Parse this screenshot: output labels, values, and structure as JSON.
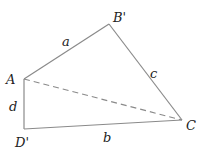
{
  "diagram": {
    "title": "",
    "vertices": [
      {
        "id": "A",
        "label": "A",
        "x": 24,
        "y": 79,
        "lx": 6,
        "ly": 84
      },
      {
        "id": "B'",
        "label": "B'",
        "x": 109,
        "y": 24,
        "lx": 113,
        "ly": 22
      },
      {
        "id": "C",
        "label": "C",
        "x": 182,
        "y": 120,
        "lx": 186,
        "ly": 130
      },
      {
        "id": "D'",
        "label": "D'",
        "x": 24,
        "y": 129,
        "lx": 15,
        "ly": 147
      }
    ],
    "edges": [
      {
        "from": "A",
        "to": "B'",
        "label": "a",
        "style": "solid",
        "lx": 62,
        "ly": 46
      },
      {
        "from": "B'",
        "to": "C",
        "label": "c",
        "style": "solid",
        "lx": 150,
        "ly": 78
      },
      {
        "from": "D'",
        "to": "C",
        "label": "b",
        "style": "solid",
        "lx": 103,
        "ly": 142
      },
      {
        "from": "A",
        "to": "D'",
        "label": "d",
        "style": "solid",
        "lx": 9,
        "ly": 111
      },
      {
        "from": "A",
        "to": "C",
        "label": "",
        "style": "dashed"
      }
    ],
    "colors": {
      "line": "#888888",
      "text": "#222222"
    }
  }
}
